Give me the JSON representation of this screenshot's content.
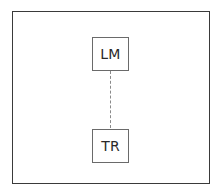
{
  "diagram": {
    "type": "node-link",
    "frame": {
      "border_color": "#3a3a3a"
    },
    "nodes": [
      {
        "id": "LM",
        "label": "LM"
      },
      {
        "id": "TR",
        "label": "TR"
      }
    ],
    "edges": [
      {
        "from": "LM",
        "to": "TR",
        "style": "dashed",
        "color": "#8a8a8a"
      }
    ]
  }
}
